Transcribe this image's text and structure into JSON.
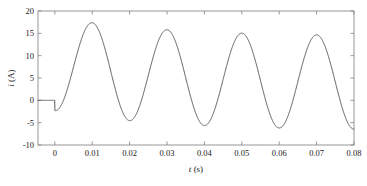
{
  "chart_data": {
    "type": "line",
    "title": "",
    "subtitle": "",
    "xlabel": "t (s)",
    "ylabel": "i (A)",
    "xlabel_symbol": "t",
    "xlabel_unit": "(s)",
    "ylabel_symbol": "i",
    "ylabel_unit": "(A)",
    "xlim": [
      -0.0045,
      0.08
    ],
    "ylim": [
      -10,
      20
    ],
    "xticks": [
      0,
      0.01,
      0.02,
      0.03,
      0.04,
      0.05,
      0.06,
      0.07,
      0.08
    ],
    "xticklabels": [
      "0",
      "0.01",
      "0.02",
      "0.03",
      "0.04",
      "0.05",
      "0.06",
      "0.07",
      "0.08"
    ],
    "yticks": [
      -10,
      -5,
      0,
      5,
      10,
      15,
      20
    ],
    "yticklabels": [
      "-10",
      "-5",
      "0",
      "5",
      "10",
      "15",
      "20"
    ],
    "grid": false,
    "legend": null,
    "legend_position": "none",
    "tick_direction": "in",
    "line_color": "#5a5a5a",
    "line_width": 1.0,
    "frame_color": "#8c8c8c",
    "background": "#ffffff",
    "annotations": [],
    "series": [
      {
        "name": "i(t)",
        "color": "#5a5a5a",
        "peaks": [
          {
            "t": 0.009,
            "i": 18.7
          },
          {
            "t": 0.029,
            "i": 16.5
          },
          {
            "t": 0.049,
            "i": 15.0
          },
          {
            "t": 0.069,
            "i": 14.0
          }
        ],
        "troughs": [
          {
            "t": 0.0195,
            "i": -2.3
          },
          {
            "t": 0.0395,
            "i": -4.2
          },
          {
            "t": 0.0595,
            "i": -5.4
          },
          {
            "t": 0.0795,
            "i": -6.4
          }
        ],
        "model": {
          "start_time": 0.0,
          "before_start_value": 0.0,
          "frequency_hz": 50,
          "ac_amplitude": 10.5,
          "dc_initial": 8.2,
          "dc_final": 3.8,
          "dc_decay_tau": 0.028,
          "phase_deg": -90
        }
      }
    ]
  }
}
